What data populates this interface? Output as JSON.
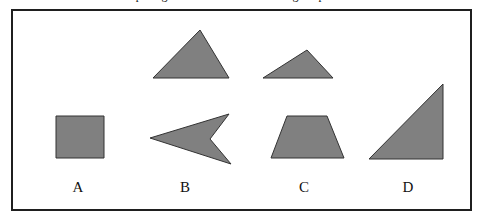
{
  "figure": {
    "caption_clipped": "comparing the areas of the following shapes below",
    "frame": {
      "border_color": "#1f1f1f",
      "background_color": "#ffffff",
      "border_width_px": 2
    },
    "style": {
      "shape_fill": "#808080",
      "shape_stroke": "#333333",
      "stroke_width_px": 1
    },
    "labels": [
      {
        "id": "A",
        "text": "A"
      },
      {
        "id": "B",
        "text": "B"
      },
      {
        "id": "C",
        "text": "C"
      },
      {
        "id": "D",
        "text": "D"
      }
    ],
    "shapes": [
      {
        "name": "square",
        "label": "A",
        "row": "bottom",
        "points": "56,116 104,116 104,158 56,158"
      },
      {
        "name": "arrowhead-chevron",
        "label": "B",
        "row": "bottom",
        "points": "150,138 229,114 210,139 231,164"
      },
      {
        "name": "trapezoid",
        "label": "C",
        "row": "bottom",
        "points": "287,116 327,116 344,158 271,158"
      },
      {
        "name": "right-triangle",
        "label": "D",
        "row": "bottom",
        "points": "443,84 443,159 369,159"
      },
      {
        "name": "isosceles-triangle",
        "row": "top",
        "points": "200,30 229,78 153,78"
      },
      {
        "name": "obtuse-flat-triangle",
        "row": "top",
        "points": "307,50 333,78 263,78"
      }
    ]
  }
}
